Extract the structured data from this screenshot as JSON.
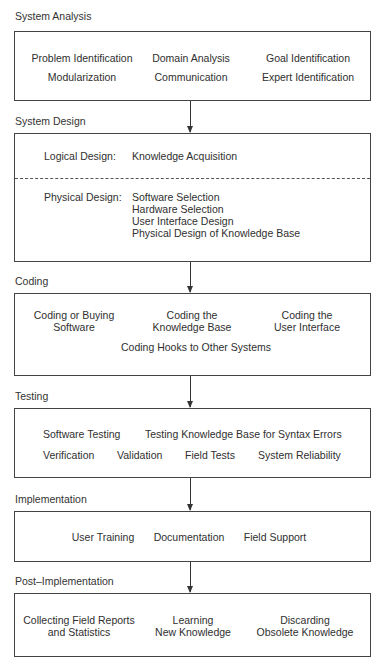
{
  "diagram": {
    "type": "process-flow",
    "direction": "top-to-bottom",
    "stages": [
      {
        "title": "System Analysis",
        "items": [
          "Problem Identification",
          "Domain Analysis",
          "Goal Identification",
          "Modularization",
          "Communication",
          "Expert Identification"
        ]
      },
      {
        "title": "System Design",
        "logical": {
          "label": "Logical Design:",
          "items": [
            "Knowledge Acquisition"
          ]
        },
        "physical": {
          "label": "Physical Design:",
          "items": [
            "Software Selection",
            "Hardware Selection",
            "User Interface Design",
            "Physical Design of Knowledge Base"
          ]
        }
      },
      {
        "title": "Coding",
        "items": [
          "Coding or Buying",
          "Software",
          "Coding the",
          "Knowledge Base",
          "Coding the",
          "User Interface",
          "Coding Hooks to Other Systems"
        ]
      },
      {
        "title": "Testing",
        "items": [
          "Software Testing",
          "Testing Knowledge Base for Syntax Errors",
          "Verification",
          "Validation",
          "Field Tests",
          "System Reliability"
        ]
      },
      {
        "title": "Implementation",
        "items": [
          "User Training",
          "Documentation",
          "Field Support"
        ]
      },
      {
        "title": "Post–Implementation",
        "items": [
          "Collecting Field Reports",
          "and Statistics",
          "Learning",
          "New Knowledge",
          "Discarding",
          "Obsolete Knowledge"
        ]
      }
    ],
    "edges": [
      {
        "from": "System Analysis",
        "to": "System Design"
      },
      {
        "from": "System Design",
        "to": "Coding"
      },
      {
        "from": "Coding",
        "to": "Testing"
      },
      {
        "from": "Testing",
        "to": "Implementation"
      },
      {
        "from": "Implementation",
        "to": "Post–Implementation"
      }
    ]
  }
}
